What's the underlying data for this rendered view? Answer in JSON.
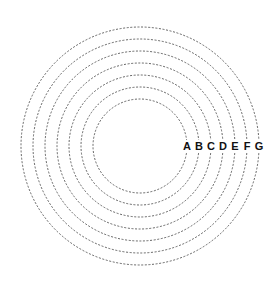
{
  "diagram": {
    "type": "concentric-circles",
    "center": {
      "x": 140,
      "y": 146
    },
    "line_style": "dashed",
    "line_color": "#555555",
    "label_color": "#111111",
    "rings": [
      {
        "label": "A",
        "radius": 47
      },
      {
        "label": "B",
        "radius": 59
      },
      {
        "label": "C",
        "radius": 71
      },
      {
        "label": "D",
        "radius": 83
      },
      {
        "label": "E",
        "radius": 95
      },
      {
        "label": "F",
        "radius": 107
      },
      {
        "label": "G",
        "radius": 119
      }
    ]
  }
}
